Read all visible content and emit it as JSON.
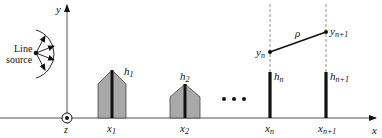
{
  "figure": {
    "axes": {
      "x_label": "x",
      "y_label": "y",
      "z_label": "z"
    },
    "source": {
      "label_line1": "Line",
      "label_line2": "source",
      "ray_count": 4
    },
    "buildings": [
      {
        "label": "h",
        "label_sub": "1",
        "x_label": "x",
        "x_sub": "1",
        "shape": "house"
      },
      {
        "label": "h",
        "label_sub": "2",
        "x_label": "x",
        "x_sub": "2",
        "shape": "house"
      }
    ],
    "ellipsis": "• • •",
    "knife_edges": [
      {
        "h_label": "h",
        "h_sub": "n",
        "x_label": "x",
        "x_sub": "n",
        "y_label": "y",
        "y_sub": "n"
      },
      {
        "h_label": "h",
        "h_sub": "n+1",
        "x_label": "x",
        "x_sub": "n+1",
        "y_label": "y",
        "y_sub": "n+1"
      }
    ],
    "segment_label": "ρ",
    "colors": {
      "building_fill": "#a9a9a9",
      "line": "#111111",
      "axis": "#555555",
      "dashed": "#777777"
    }
  }
}
